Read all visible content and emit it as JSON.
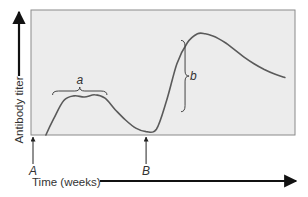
{
  "chart_data": {
    "type": "line",
    "title": "",
    "xlabel": "Time (weeks)",
    "ylabel": "Antibody titer",
    "x_unit": "relative time",
    "y_unit": "relative titer",
    "xlim": [
      0,
      100
    ],
    "ylim": [
      0,
      100
    ],
    "grid": false,
    "legend": "none",
    "series": [
      {
        "name": "Antibody response",
        "x": [
          5,
          8,
          12,
          16,
          20,
          24,
          28,
          32,
          36,
          40,
          44,
          48,
          52,
          56,
          60,
          64,
          67,
          70,
          72,
          75,
          78,
          82,
          86,
          90,
          94,
          98
        ],
        "y": [
          0,
          14,
          30,
          34,
          33,
          35,
          32,
          22,
          13,
          6,
          3,
          5,
          30,
          62,
          80,
          88,
          88,
          86,
          84,
          80,
          75,
          68,
          62,
          57,
          53,
          50
        ]
      }
    ],
    "annotations": [
      {
        "label": "A",
        "type": "arrow",
        "x": 0,
        "note": "first antigen exposure"
      },
      {
        "label": "B",
        "type": "arrow",
        "x": 44,
        "note": "second antigen exposure"
      },
      {
        "label": "a",
        "type": "bracket",
        "x_range": [
          8,
          28
        ],
        "note": "primary response"
      },
      {
        "label": "b",
        "type": "bracket",
        "y_range": [
          22,
          84
        ],
        "x": 58,
        "note": "secondary response rise"
      }
    ]
  },
  "labels": {
    "y_axis": "Antibody titer",
    "x_axis": "Time (weeks)",
    "marker_a_upper": "A",
    "marker_b_upper": "B",
    "bracket_a": "a",
    "bracket_b": "b"
  },
  "colors": {
    "plot_bg": "#ececec",
    "plot_border": "#8a8a8a",
    "curve": "#5a5a5a",
    "arrow": "#111111",
    "text": "#333333"
  }
}
